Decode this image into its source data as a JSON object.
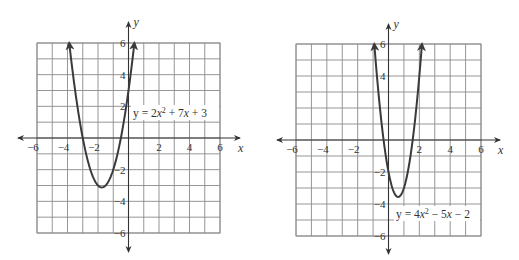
{
  "chart_data": [
    {
      "type": "line",
      "title": "",
      "equation": "y = 2x² + 7x + 3",
      "equation_parts": {
        "pre": "y = 2",
        "var1": "x",
        "sup": "2",
        "mid": " + 7",
        "var2": "x",
        "post": " + 3"
      },
      "xlabel": "x",
      "ylabel": "y",
      "xlim": [
        -6,
        6
      ],
      "ylim": [
        -6,
        6
      ],
      "grid": true,
      "x_ticks": [
        -6,
        -4,
        -2,
        2,
        4,
        6
      ],
      "y_ticks": [
        6,
        4,
        2,
        -2,
        -4,
        -6
      ],
      "x_tick_labels": [
        "−6",
        "−4",
        "−2",
        "2",
        "4",
        "6"
      ],
      "y_tick_labels": [
        "6",
        "4",
        "2",
        "−2",
        "−4",
        "−6"
      ],
      "coefficients": {
        "a": 2,
        "b": 7,
        "c": 3
      },
      "domain_plotted": [
        -3.886,
        0.386
      ],
      "vertex": {
        "x": -1.75,
        "y": -3.125
      },
      "x_intercepts": [
        -3,
        -0.5
      ],
      "y_intercept": 3,
      "endpoints_arrows": true,
      "series": [
        {
          "name": "y = 2x² + 7x + 3",
          "x": [
            -3.886,
            -3.5,
            -3,
            -2.5,
            -2,
            -1.75,
            -1.5,
            -1,
            -0.5,
            0,
            0.386
          ],
          "y": [
            6,
            3,
            0,
            -1.5,
            -3,
            -3.125,
            -3,
            -2,
            0,
            3,
            6
          ]
        }
      ]
    },
    {
      "type": "line",
      "title": "",
      "equation": "y = 4x² − 5x − 2",
      "equation_parts": {
        "pre": "y = 4",
        "var1": "x",
        "sup": "2",
        "mid": " − 5",
        "var2": "x",
        "post": " − 2"
      },
      "xlabel": "x",
      "ylabel": "y",
      "xlim": [
        -6,
        6
      ],
      "ylim": [
        -6,
        6
      ],
      "grid": true,
      "x_ticks": [
        -6,
        -4,
        -2,
        2,
        4,
        6
      ],
      "y_ticks": [
        6,
        4,
        2,
        -2,
        -4,
        -6
      ],
      "x_tick_labels": [
        "−6",
        "−4",
        "−2",
        "2",
        "4",
        "6"
      ],
      "y_tick_labels": [
        "6",
        "4",
        "",
        "−2",
        "−4",
        "−6"
      ],
      "coefficients": {
        "a": 4,
        "b": -5,
        "c": -2
      },
      "domain_plotted": [
        -0.921,
        2.171
      ],
      "vertex": {
        "x": 0.625,
        "y": -3.5625
      },
      "x_intercepts": [
        -0.31,
        1.56
      ],
      "y_intercept": -2,
      "endpoints_arrows": true,
      "series": [
        {
          "name": "y = 4x² − 5x − 2",
          "x": [
            -0.921,
            -0.5,
            0,
            0.625,
            1,
            1.5,
            2,
            2.171
          ],
          "y": [
            6,
            1.5,
            -2,
            -3.5625,
            -3,
            -0.5,
            4,
            6
          ]
        }
      ]
    }
  ],
  "graphs": [
    {
      "box": {
        "left": 37,
        "top": 43,
        "right": 220,
        "bottom": 233
      },
      "axis_ext": {
        "xmin": 18,
        "xmax": 240,
        "ymin": 22,
        "ymax": 252
      },
      "label_box": {
        "x": 131,
        "y": 105,
        "w": 88,
        "h": 15
      }
    },
    {
      "box": {
        "left": 296,
        "top": 44,
        "right": 481,
        "bottom": 236
      },
      "axis_ext": {
        "xmin": 277,
        "xmax": 500,
        "ymin": 24,
        "ymax": 254
      },
      "label_box": {
        "x": 394,
        "y": 206,
        "w": 86,
        "h": 15
      }
    }
  ]
}
